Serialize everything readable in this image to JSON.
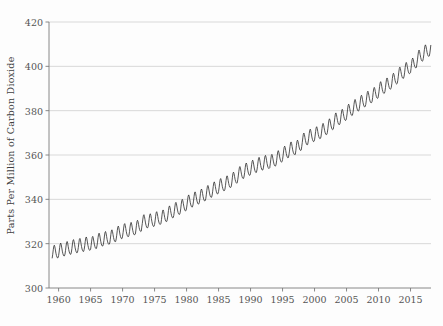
{
  "chart_data": {
    "type": "line",
    "title": "",
    "subtitle": "",
    "xlabel": "",
    "ylabel": "Parts Per Million of Carbon Dioxide",
    "xlim": [
      1958.5,
      2018.2
    ],
    "ylim": [
      300,
      420
    ],
    "grid": true,
    "grid_axis": "y",
    "legend": "none",
    "line_color": "#2b2b2b",
    "grid_color": "#c8c8c8",
    "axis_color": "#7a7a7a",
    "ytick_labels": [
      "300",
      "320",
      "340",
      "360",
      "380",
      "400",
      "420"
    ],
    "ytick_values": [
      300,
      320,
      340,
      360,
      380,
      400,
      420
    ],
    "xtick_labels": [
      "1960",
      "1965",
      "1970",
      "1975",
      "1980",
      "1985",
      "1990",
      "1995",
      "2000",
      "2005",
      "2010",
      "2015"
    ],
    "xtick_values": [
      1960,
      1965,
      1970,
      1975,
      1980,
      1985,
      1990,
      1995,
      2000,
      2005,
      2010,
      2015
    ],
    "series": [
      {
        "name": "Atmospheric CO2 (monthly mean)",
        "x_start": 1959.0,
        "x_step": 0.0833333,
        "annual_means": [
          315.98,
          316.91,
          317.64,
          318.45,
          318.99,
          319.62,
          320.04,
          321.38,
          322.16,
          323.04,
          324.62,
          325.68,
          326.32,
          327.45,
          329.68,
          330.18,
          331.11,
          332.04,
          333.83,
          335.4,
          336.84,
          338.75,
          340.11,
          341.45,
          343.05,
          344.65,
          346.12,
          347.42,
          349.19,
          351.57,
          353.12,
          354.39,
          355.61,
          356.45,
          357.1,
          358.83,
          360.82,
          362.61,
          363.73,
          366.7,
          368.38,
          369.55,
          371.14,
          373.28,
          375.8,
          377.52,
          379.8,
          381.9,
          383.79,
          385.6,
          387.43,
          389.9,
          391.65,
          393.85,
          396.52,
          398.65,
          400.83,
          404.24,
          406.55,
          408.52
        ],
        "seasonal_amplitude": 6.2,
        "seasonal_peak_month": 5,
        "units": "ppm",
        "n_points": 720,
        "first_value": 315.98,
        "last_value": 408.52,
        "min_value": 312.4,
        "max_value": 411.2
      }
    ]
  },
  "axes": {
    "y_axis_label": "Parts Per Million of Carbon Dioxide"
  }
}
